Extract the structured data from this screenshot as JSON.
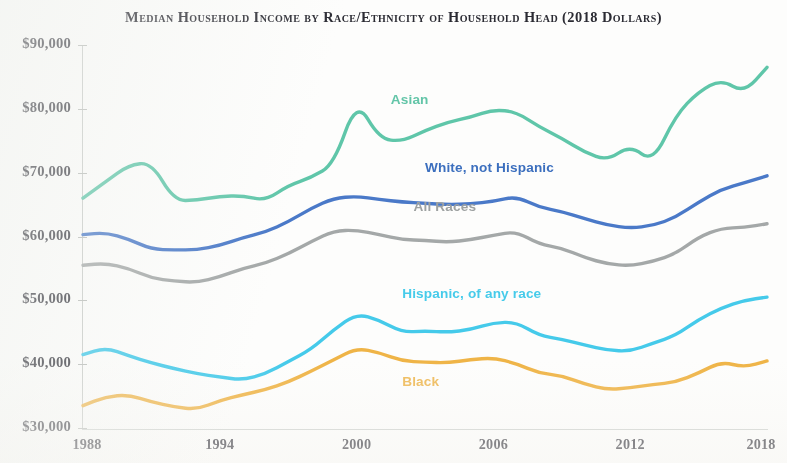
{
  "chart_data": {
    "type": "line",
    "title": "Median Household Income by Race/Ethnicity of Household Head (2018 Dollars)",
    "xlabel": "",
    "ylabel": "",
    "xlim": [
      1988,
      2018
    ],
    "ylim": [
      30000,
      90000
    ],
    "grid": false,
    "legend_position": "inline-labels",
    "x_tick_labels": [
      "1988",
      "1994",
      "2000",
      "2006",
      "2012",
      "2018"
    ],
    "x_ticks": [
      1988,
      1994,
      2000,
      2006,
      2012,
      2018
    ],
    "y_tick_labels": [
      "$90,000",
      "$80,000",
      "$70,000",
      "$60,000",
      "$50,000",
      "$40,000",
      "$30,000"
    ],
    "y_ticks": [
      90000,
      80000,
      70000,
      60000,
      50000,
      40000,
      30000
    ],
    "x": [
      1988,
      1989,
      1990,
      1991,
      1992,
      1993,
      1994,
      1995,
      1996,
      1997,
      1998,
      1999,
      2000,
      2001,
      2002,
      2003,
      2004,
      2005,
      2006,
      2007,
      2008,
      2009,
      2010,
      2011,
      2012,
      2013,
      2014,
      2015,
      2016,
      2017,
      2018
    ],
    "series": [
      {
        "name": "Asian",
        "color": "#5FC6A9",
        "label_color": "#63C5A8",
        "values": [
          66000,
          68600,
          71200,
          71600,
          65600,
          65700,
          66300,
          66400,
          65600,
          68000,
          69200,
          71300,
          81400,
          75300,
          74900,
          76600,
          77900,
          78700,
          79900,
          79500,
          77200,
          75400,
          73200,
          71900,
          74300,
          71600,
          79000,
          82700,
          84600,
          82500,
          86500
        ]
      },
      {
        "name": "White, not Hispanic",
        "color": "#4A79C8",
        "label_color": "#3C6FBE",
        "values": [
          60300,
          60600,
          59600,
          58000,
          57900,
          57900,
          58600,
          59800,
          60700,
          62300,
          64400,
          66000,
          66300,
          65800,
          65400,
          65200,
          65000,
          65100,
          65500,
          66300,
          64600,
          63900,
          62800,
          61800,
          61300,
          61700,
          63000,
          65400,
          67400,
          68400,
          69500
        ]
      },
      {
        "name": "All Races",
        "color": "#A4A8A8",
        "label_color": "#9DA1A1",
        "values": [
          55500,
          55800,
          55000,
          53500,
          53000,
          52800,
          53700,
          55000,
          55800,
          57300,
          59200,
          60900,
          61000,
          60300,
          59500,
          59400,
          59100,
          59500,
          60200,
          60800,
          58800,
          58200,
          56700,
          55700,
          55400,
          56100,
          57300,
          59900,
          61300,
          61400,
          62000
        ]
      },
      {
        "name": "Hispanic, of any race",
        "color": "#45CAEA",
        "label_color": "#46CBEA",
        "values": [
          41500,
          42600,
          41300,
          40200,
          39300,
          38500,
          38000,
          37500,
          38500,
          40400,
          42300,
          45400,
          47900,
          46900,
          45000,
          45200,
          45000,
          45400,
          46500,
          46600,
          44500,
          43900,
          43000,
          42200,
          42000,
          43300,
          44500,
          47000,
          48800,
          50000,
          50500
        ]
      },
      {
        "name": "Black",
        "color": "#EFB447",
        "label_color": "#EFBB5A",
        "values": [
          33500,
          34900,
          35200,
          34100,
          33300,
          32900,
          34300,
          35200,
          36000,
          37200,
          38900,
          40700,
          42500,
          41800,
          40500,
          40300,
          40200,
          40700,
          41000,
          40100,
          38600,
          38200,
          36900,
          36000,
          36300,
          36800,
          37200,
          38600,
          40400,
          39500,
          40500
        ]
      }
    ],
    "annotations": [
      {
        "text": "Asian",
        "x": 2001.5,
        "y": 81200
      },
      {
        "text": "White, not Hispanic",
        "x": 2003.0,
        "y": 70500
      },
      {
        "text": "All Races",
        "x": 2002.5,
        "y": 64400
      },
      {
        "text": "Hispanic, of any race",
        "x": 2002.0,
        "y": 50800
      },
      {
        "text": "Black",
        "x": 2002.0,
        "y": 37000
      }
    ]
  }
}
